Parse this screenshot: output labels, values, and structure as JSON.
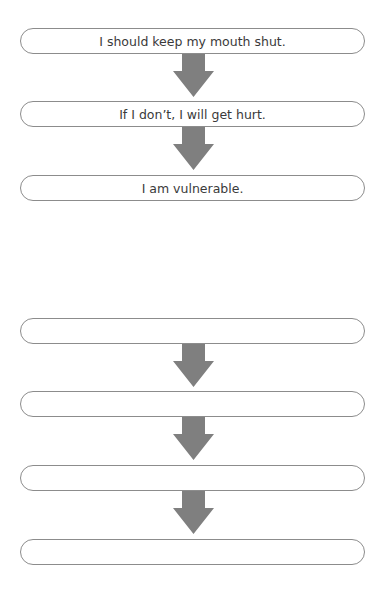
{
  "diagram": {
    "colors": {
      "arrow": "#7f7f7f",
      "border": "#8c8c8c",
      "text": "#3a3a3a"
    },
    "example_chain": [
      {
        "text": "I should keep my mouth shut."
      },
      {
        "text": "If I don’t, I will get hurt."
      },
      {
        "text": "I am vulnerable."
      }
    ],
    "blank_chain": [
      {
        "text": ""
      },
      {
        "text": ""
      },
      {
        "text": ""
      },
      {
        "text": ""
      }
    ]
  }
}
